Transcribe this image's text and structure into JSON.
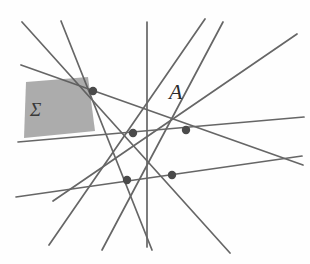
{
  "figure": {
    "type": "projective-geometry-diagram",
    "background_color": "#fefefe",
    "line_color": "#5a5a5a",
    "node_color": "#4a4a4a",
    "shade_fill": "#9a9a9a",
    "label_color": "#2b2b2b"
  },
  "labels": {
    "point_A": "A",
    "region_sigma": "Σ"
  },
  "nodes": [
    {
      "id": "n1",
      "x": 93,
      "y": 91
    },
    {
      "id": "n2",
      "x": 133,
      "y": 133
    },
    {
      "id": "n3",
      "x": 186,
      "y": 130
    },
    {
      "id": "n4",
      "x": 127,
      "y": 180
    },
    {
      "id": "n5",
      "x": 172,
      "y": 175
    }
  ],
  "lines": [
    {
      "id": "L1",
      "x1": 22,
      "y1": 22,
      "x2": 230,
      "y2": 253
    },
    {
      "id": "L2",
      "x1": 61,
      "y1": 21,
      "x2": 152,
      "y2": 250
    },
    {
      "id": "L3",
      "x1": 147,
      "y1": 22,
      "x2": 147,
      "y2": 247
    },
    {
      "id": "L4",
      "x1": 223,
      "y1": 22,
      "x2": 102,
      "y2": 250
    },
    {
      "id": "L5",
      "x1": 297,
      "y1": 34,
      "x2": 53,
      "y2": 201
    },
    {
      "id": "L6",
      "x1": 21,
      "y1": 65,
      "x2": 303,
      "y2": 165
    },
    {
      "id": "L7",
      "x1": 18,
      "y1": 142,
      "x2": 304,
      "y2": 117
    },
    {
      "id": "L8",
      "x1": 16,
      "y1": 197,
      "x2": 302,
      "y2": 156
    },
    {
      "id": "L9",
      "x1": 49,
      "y1": 245,
      "x2": 205,
      "y2": 19
    }
  ],
  "shaded_region": {
    "id": "sigma-quad",
    "points": "26,82 88,77 95,131 24,138",
    "fill": "#9a9a9a"
  }
}
